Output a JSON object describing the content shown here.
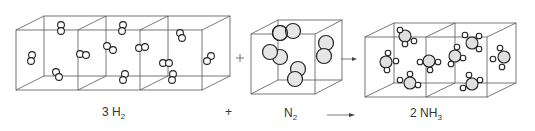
{
  "equation": {
    "reactant1": {
      "coefficient": "3",
      "formula": "H",
      "subscript": "2",
      "label_text": "3 H2"
    },
    "plus": "+",
    "reactant2": {
      "coefficient": "",
      "formula": "N",
      "subscript": "2",
      "label_text": "N2"
    },
    "arrow": "→",
    "product": {
      "coefficient": "2",
      "formula": "NH",
      "subscript": "3",
      "label_text": "2 NH3"
    }
  },
  "panels": [
    {
      "name": "hydrogen-boxes",
      "cube_count": 3,
      "molecule": "H2",
      "molecule_count": 12
    },
    {
      "name": "nitrogen-box",
      "cube_count": 1,
      "molecule": "N2",
      "molecule_count": 4
    },
    {
      "name": "ammonia-boxes",
      "cube_count": 2,
      "molecule": "NH3",
      "molecule_count": 8
    }
  ],
  "colors": {
    "line": "#555555",
    "atom_outline": "#222222",
    "hydrogen_fill": "#ffffff",
    "nitrogen_fill": "#e6e6e6",
    "text": "#333333"
  }
}
